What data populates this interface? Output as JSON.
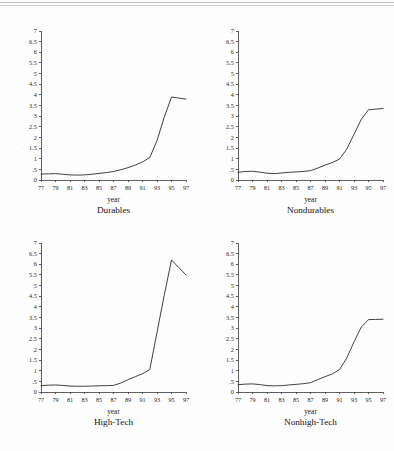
{
  "page": {
    "background_color": "#fdfdfd",
    "ink_color": "#2b2b2b",
    "header_rule_color": "#c9c9c9"
  },
  "figure": {
    "panel_count": 4,
    "layout": "2x2 grid of line plots"
  },
  "chart_data": [
    {
      "type": "line",
      "title": "Durables",
      "xlabel": "year",
      "ylabel": "",
      "grid": false,
      "legend": "none",
      "xlim": [
        77,
        97
      ],
      "ylim": [
        0,
        7
      ],
      "xticklabels": [
        "77",
        "79",
        "81",
        "83",
        "85",
        "87",
        "89",
        "91",
        "93",
        "95",
        "97"
      ],
      "xtickvalues": [
        77,
        79,
        81,
        83,
        85,
        87,
        89,
        91,
        93,
        95,
        97
      ],
      "yticklabels": [
        "0",
        ".5",
        "1",
        "1.5",
        "2",
        "2.5",
        "3",
        "3.5",
        "4",
        "4.5",
        "5",
        "5.5",
        "6",
        "6.5",
        "7"
      ],
      "ytickvalues": [
        0,
        0.5,
        1,
        1.5,
        2,
        2.5,
        3,
        3.5,
        4,
        4.5,
        5,
        5.5,
        6,
        6.5,
        7
      ],
      "x": [
        77,
        78,
        79,
        80,
        81,
        82,
        83,
        84,
        85,
        86,
        87,
        88,
        89,
        90,
        91,
        92,
        93,
        94,
        95,
        96,
        97
      ],
      "values": [
        0.28,
        0.29,
        0.3,
        0.27,
        0.24,
        0.23,
        0.24,
        0.27,
        0.31,
        0.35,
        0.4,
        0.48,
        0.58,
        0.7,
        0.85,
        1.05,
        1.85,
        2.95,
        3.9,
        3.85,
        3.8
      ]
    },
    {
      "type": "line",
      "title": "Nondurables",
      "xlabel": "year",
      "ylabel": "",
      "grid": false,
      "legend": "none",
      "xlim": [
        77,
        97
      ],
      "ylim": [
        0,
        7
      ],
      "xticklabels": [
        "77",
        "79",
        "81",
        "83",
        "85",
        "87",
        "89",
        "91",
        "93",
        "95",
        "97"
      ],
      "xtickvalues": [
        77,
        79,
        81,
        83,
        85,
        87,
        89,
        91,
        93,
        95,
        97
      ],
      "yticklabels": [
        "0",
        ".5",
        "1",
        "1.5",
        "2",
        "2.5",
        "3",
        "3.5",
        "4",
        "4.5",
        "5",
        "5.5",
        "6",
        "6.5",
        "7"
      ],
      "ytickvalues": [
        0,
        0.5,
        1,
        1.5,
        2,
        2.5,
        3,
        3.5,
        4,
        4.5,
        5,
        5.5,
        6,
        6.5,
        7
      ],
      "x": [
        77,
        78,
        79,
        80,
        81,
        82,
        83,
        84,
        85,
        86,
        87,
        88,
        89,
        90,
        91,
        92,
        93,
        94,
        95,
        96,
        97
      ],
      "values": [
        0.36,
        0.4,
        0.41,
        0.37,
        0.32,
        0.3,
        0.33,
        0.36,
        0.38,
        0.4,
        0.44,
        0.56,
        0.7,
        0.82,
        0.98,
        1.45,
        2.15,
        2.85,
        3.3,
        3.33,
        3.36
      ]
    },
    {
      "type": "line",
      "title": "High-Tech",
      "xlabel": "year",
      "ylabel": "",
      "grid": false,
      "legend": "none",
      "xlim": [
        77,
        97
      ],
      "ylim": [
        0,
        7
      ],
      "xticklabels": [
        "77",
        "79",
        "81",
        "83",
        "85",
        "87",
        "89",
        "91",
        "93",
        "95",
        "97"
      ],
      "xtickvalues": [
        77,
        79,
        81,
        83,
        85,
        87,
        89,
        91,
        93,
        95,
        97
      ],
      "yticklabels": [
        "0",
        ".5",
        "1",
        "1.5",
        "2",
        "2.5",
        "3",
        "3.5",
        "4",
        "4.5",
        "5",
        "5.5",
        "6",
        "6.5",
        "7"
      ],
      "ytickvalues": [
        0,
        0.5,
        1,
        1.5,
        2,
        2.5,
        3,
        3.5,
        4,
        4.5,
        5,
        5.5,
        6,
        6.5,
        7
      ],
      "x": [
        77,
        78,
        79,
        80,
        81,
        82,
        83,
        84,
        85,
        86,
        87,
        88,
        89,
        90,
        91,
        92,
        93,
        94,
        95,
        96,
        97
      ],
      "values": [
        0.3,
        0.32,
        0.33,
        0.31,
        0.28,
        0.27,
        0.27,
        0.28,
        0.29,
        0.3,
        0.31,
        0.42,
        0.58,
        0.72,
        0.86,
        1.05,
        2.8,
        4.55,
        6.2,
        5.85,
        5.5
      ]
    },
    {
      "type": "line",
      "title": "Nonhigh-Tech",
      "xlabel": "year",
      "ylabel": "",
      "grid": false,
      "legend": "none",
      "xlim": [
        77,
        97
      ],
      "ylim": [
        0,
        7
      ],
      "xticklabels": [
        "77",
        "79",
        "81",
        "83",
        "85",
        "87",
        "89",
        "91",
        "93",
        "95",
        "97"
      ],
      "xtickvalues": [
        77,
        79,
        81,
        83,
        85,
        87,
        89,
        91,
        93,
        95,
        97
      ],
      "yticklabels": [
        "0",
        ".5",
        "1",
        "1.5",
        "2",
        "2.5",
        "3",
        "3.5",
        "4",
        "4.5",
        "5",
        "5.5",
        "6",
        "6.5",
        "7"
      ],
      "ytickvalues": [
        0,
        0.5,
        1,
        1.5,
        2,
        2.5,
        3,
        3.5,
        4,
        4.5,
        5,
        5.5,
        6,
        6.5,
        7
      ],
      "x": [
        77,
        78,
        79,
        80,
        81,
        82,
        83,
        84,
        85,
        86,
        87,
        88,
        89,
        90,
        91,
        92,
        93,
        94,
        95,
        96,
        97
      ],
      "values": [
        0.34,
        0.37,
        0.38,
        0.35,
        0.3,
        0.29,
        0.3,
        0.33,
        0.36,
        0.39,
        0.44,
        0.58,
        0.72,
        0.85,
        1.05,
        1.6,
        2.35,
        3.05,
        3.4,
        3.41,
        3.42
      ]
    }
  ]
}
